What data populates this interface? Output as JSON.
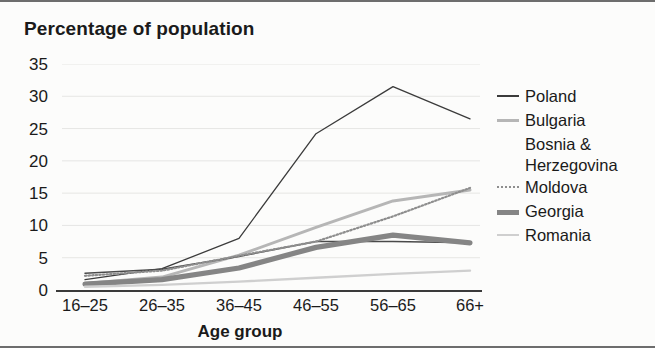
{
  "chart": {
    "title": "Percentage of population",
    "xlabel": "Age group"
  },
  "legend": {
    "items": [
      {
        "label": "Poland"
      },
      {
        "label": "Bulgaria"
      },
      {
        "label": "Bosnia &\nHerzegovina"
      },
      {
        "label": "Moldova"
      },
      {
        "label": "Georgia"
      },
      {
        "label": "Romania"
      }
    ]
  },
  "chart_data": {
    "type": "line",
    "title": "Percentage of population",
    "xlabel": "Age group",
    "ylabel": "",
    "categories": [
      "16–25",
      "26–35",
      "36–45",
      "46–55",
      "56–65",
      "66+"
    ],
    "yticks": [
      0,
      5,
      10,
      15,
      20,
      25,
      30,
      35
    ],
    "ylim": [
      0,
      35
    ],
    "grid": true,
    "grid_axis": "y",
    "legend_position": "right",
    "series": [
      {
        "name": "Poland",
        "color": "#3b3b3b",
        "style": "solid",
        "width": 1.3,
        "values": [
          1.6,
          3.3,
          8.0,
          24.2,
          31.5,
          26.5
        ]
      },
      {
        "name": "Bulgaria",
        "color": "#b6b6b6",
        "style": "solid",
        "width": 3.0,
        "values": [
          1.0,
          2.0,
          5.4,
          9.7,
          13.8,
          15.5
        ]
      },
      {
        "name": "Bosnia & Herzegovina",
        "color": "#4a4a4a",
        "style": "solid",
        "width": 1.5,
        "values": [
          2.6,
          3.2,
          5.2,
          7.5,
          7.5,
          7.3
        ]
      },
      {
        "name": "Moldova",
        "color": "#8e8e8e",
        "style": "dotted",
        "width": 2.2,
        "values": [
          2.2,
          3.0,
          5.3,
          7.5,
          11.4,
          15.8
        ]
      },
      {
        "name": "Georgia",
        "color": "#858585",
        "style": "solid",
        "width": 5.2,
        "values": [
          0.9,
          1.6,
          3.4,
          6.6,
          8.5,
          7.3
        ]
      },
      {
        "name": "Romania",
        "color": "#cfcfcf",
        "style": "solid",
        "width": 2.4,
        "values": [
          0.5,
          0.8,
          1.3,
          1.9,
          2.5,
          3.0
        ]
      }
    ]
  }
}
